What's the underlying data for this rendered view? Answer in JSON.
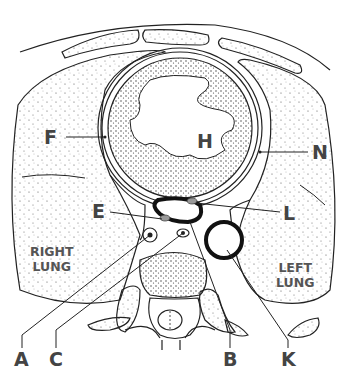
{
  "diagram": {
    "type": "anatomical cross-section (thorax, transverse)",
    "colors": {
      "line": "#222222",
      "stipple": "#555555",
      "label": "#444444",
      "highlight": "#999999"
    }
  },
  "labels": {
    "F": "F",
    "H": "H",
    "N": "N",
    "E": "E",
    "L": "L",
    "A": "A",
    "C": "C",
    "B": "B",
    "K": "K",
    "right_lung": [
      "RIGHT",
      "LUNG"
    ],
    "left_lung": [
      "LEFT",
      "LUNG"
    ]
  }
}
